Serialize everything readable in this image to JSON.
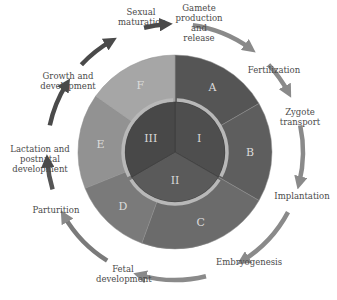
{
  "diagram": {
    "title": "",
    "center": [
      175,
      152
    ],
    "outer_radius": 97,
    "inner_radius": 50,
    "outer_segments": [
      {
        "label": "A",
        "start": 0,
        "end": 60,
        "color": "#555555"
      },
      {
        "label": "B",
        "start": 60,
        "end": 120,
        "color": "#5e5e5e"
      },
      {
        "label": "C",
        "start": 120,
        "end": 200,
        "color": "#6b6b6b"
      },
      {
        "label": "D",
        "start": 200,
        "end": 248,
        "color": "#7a7a7a"
      },
      {
        "label": "E",
        "start": 248,
        "end": 305,
        "color": "#929292"
      },
      {
        "label": "F",
        "start": 305,
        "end": 360,
        "color": "#a6a6a6"
      }
    ],
    "inner_segments": [
      {
        "label": "I",
        "start": 0,
        "end": 120,
        "color": "#4e4e4e"
      },
      {
        "label": "II",
        "start": 120,
        "end": 240,
        "color": "#5a5a5a"
      },
      {
        "label": "III",
        "start": 240,
        "end": 360,
        "color": "#484848"
      }
    ],
    "cycle_stages": [
      {
        "id": "sexual-maturation",
        "label": "Sexual\nmaturation",
        "x": 118,
        "y": 7,
        "w": 46
      },
      {
        "id": "gamete-production",
        "label": "Gamete\nproduction and\nrelease",
        "x": 168,
        "y": 3,
        "w": 62
      },
      {
        "id": "fertilization",
        "label": "Fertilization",
        "x": 246,
        "y": 65,
        "w": 56
      },
      {
        "id": "zygote-transport",
        "label": "Zygote\ntransport",
        "x": 278,
        "y": 107,
        "w": 44
      },
      {
        "id": "implantation",
        "label": "Implantation",
        "x": 274,
        "y": 191,
        "w": 56
      },
      {
        "id": "embryogenesis",
        "label": "Embryogenesis",
        "x": 216,
        "y": 257,
        "w": 62
      },
      {
        "id": "fetal-development",
        "label": "Fetal\ndevelopment",
        "x": 96,
        "y": 264,
        "w": 54
      },
      {
        "id": "parturition",
        "label": "Parturition",
        "x": 30,
        "y": 205,
        "w": 52
      },
      {
        "id": "lactation",
        "label": "Lactation and\npostnatal\ndevelopment",
        "x": 10,
        "y": 144,
        "w": 60
      },
      {
        "id": "growth",
        "label": "Growth and\ndevelopment",
        "x": 40,
        "y": 71,
        "w": 56
      }
    ]
  }
}
